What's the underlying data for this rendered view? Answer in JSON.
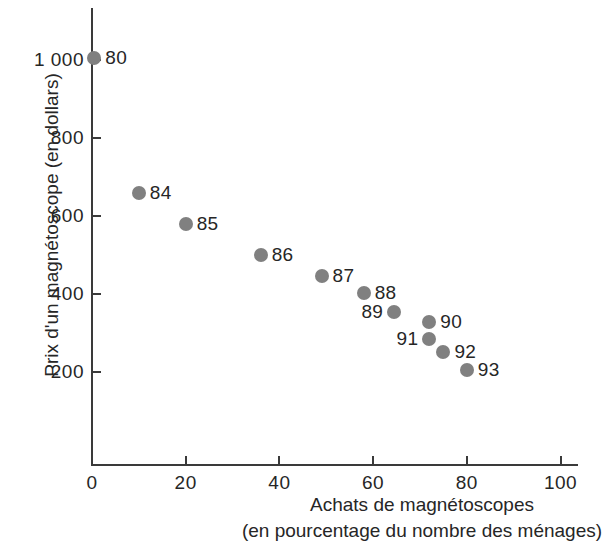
{
  "chart_data": {
    "type": "scatter",
    "title": "",
    "xlabel": "Achats de magnétoscopes (en pourcentage du nombre des ménages)",
    "ylabel": "Prix d'un magnétoscope (en dollars)",
    "xlim": [
      0,
      104
    ],
    "ylim": [
      0,
      1060
    ],
    "grid": false,
    "legend": "none",
    "point_color": "#808080",
    "axis_color": "#3a3a3a",
    "xticks": [
      {
        "value": 0,
        "label": "0"
      },
      {
        "value": 20,
        "label": "20"
      },
      {
        "value": 40,
        "label": "40"
      },
      {
        "value": 60,
        "label": "60"
      },
      {
        "value": 80,
        "label": "80"
      },
      {
        "value": 100,
        "label": "100"
      }
    ],
    "yticks": [
      {
        "value": 200,
        "label": "200"
      },
      {
        "value": 400,
        "label": "400"
      },
      {
        "value": 600,
        "label": "600"
      },
      {
        "value": 800,
        "label": "800"
      },
      {
        "value": 1000,
        "label": "1 000"
      }
    ],
    "points": [
      {
        "label": "80",
        "x": 0.5,
        "y": 1005,
        "label_side": "right"
      },
      {
        "label": "84",
        "x": 10,
        "y": 660,
        "label_side": "right"
      },
      {
        "label": "85",
        "x": 20,
        "y": 580,
        "label_side": "right"
      },
      {
        "label": "86",
        "x": 36,
        "y": 500,
        "label_side": "right"
      },
      {
        "label": "87",
        "x": 49,
        "y": 445,
        "label_side": "right"
      },
      {
        "label": "88",
        "x": 58,
        "y": 402,
        "label_side": "right"
      },
      {
        "label": "89",
        "x": 64.5,
        "y": 353,
        "label_side": "left"
      },
      {
        "label": "90",
        "x": 72,
        "y": 327,
        "label_side": "right"
      },
      {
        "label": "91",
        "x": 72,
        "y": 284,
        "label_side": "left"
      },
      {
        "label": "92",
        "x": 75,
        "y": 252,
        "label_side": "right"
      },
      {
        "label": "93",
        "x": 80,
        "y": 206,
        "label_side": "right"
      }
    ]
  },
  "axis_titles": {
    "y": "Prix d'un magnétoscope (en dollars)",
    "x_line1": "Achats de magnétoscopes",
    "x_line2": "(en pourcentage du nombre des ménages)"
  }
}
